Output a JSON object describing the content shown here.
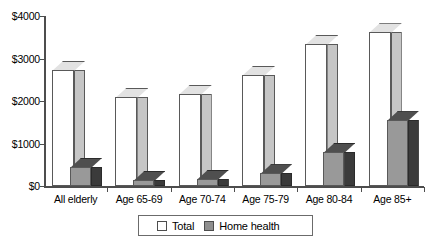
{
  "chart_data": {
    "type": "bar",
    "title": "",
    "subtitle": "",
    "xlabel": "",
    "ylabel": "",
    "categories": [
      "All elderly",
      "Age 65-69",
      "Age 70-74",
      "Age 75-79",
      "Age 80-84",
      "Age 85+"
    ],
    "series": [
      {
        "name": "Total",
        "values": [
          2730,
          2095,
          2165,
          2610,
          3340,
          3620
        ]
      },
      {
        "name": "Home health",
        "values": [
          450,
          140,
          165,
          300,
          800,
          1550
        ]
      }
    ],
    "ylim": [
      0,
      4000
    ],
    "yticks": [
      0,
      1000,
      2000,
      3000,
      4000
    ],
    "ytick_labels": [
      "$0",
      "$1000",
      "$2000",
      "$3000",
      "$4000"
    ],
    "grid": false,
    "legend_position": "bottom",
    "colors": {
      "total_front": "#ffffff",
      "total_side": "#c6c6c6",
      "total_top": "#e2e2e2",
      "home_health_front": "#999999",
      "home_health_side": "#3b3b3b",
      "home_health_top": "#4f4f4f",
      "axis": "#4d4d4d"
    }
  },
  "legend": {
    "items": [
      {
        "label": "Total"
      },
      {
        "label": "Home health"
      }
    ]
  }
}
